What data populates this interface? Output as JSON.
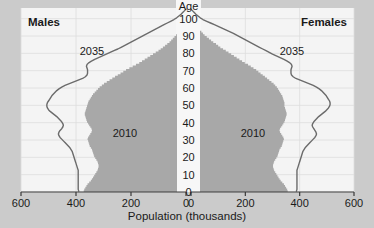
{
  "figure": {
    "background_color": "#c9c9c9",
    "plot_background_color": "#f4f4f4",
    "center_band_color": "#f7f7f7",
    "fill_2010_color": "#a8a8a8",
    "line_2035_color": "#6b6b6b",
    "axis_color": "#3a3a3a",
    "gridline_color": "#dddddd",
    "text_color": "#1a1a1a"
  },
  "labels": {
    "males": "Males",
    "females": "Females",
    "age_axis_title": "Age",
    "population_axis_title": "Population (thousands)",
    "series_outline_left": "2035",
    "series_outline_right": "2035",
    "series_fill_left": "2010",
    "series_fill_right": "2010"
  },
  "axes": {
    "x_ticks_left": [
      "600",
      "400",
      "200",
      "0"
    ],
    "x_ticks_right": [
      "0",
      "200",
      "400",
      "600"
    ],
    "x_tick_values_left": [
      600,
      400,
      200,
      0
    ],
    "x_tick_values_right": [
      0,
      200,
      400,
      600
    ],
    "x_min": 0,
    "x_max": 600,
    "y_ticks": [
      "100",
      "90",
      "80",
      "70",
      "60",
      "50",
      "40",
      "30",
      "20",
      "10",
      "0"
    ],
    "y_tick_values": [
      100,
      90,
      80,
      70,
      60,
      50,
      40,
      30,
      20,
      10,
      0
    ],
    "y_min": 0,
    "y_max": 105,
    "grid": true,
    "legend_position": "inline-annotations"
  },
  "chart_data": {
    "type": "area",
    "title": "",
    "subtitle": "",
    "xlabel": "Population (thousands)",
    "ylabel": "Age",
    "xlim": [
      0,
      600
    ],
    "ylim": [
      0,
      105
    ],
    "grid": true,
    "legend_position": "inline-annotations",
    "orientation": "population-pyramid",
    "panels": [
      {
        "name": "Males",
        "side": "left"
      },
      {
        "name": "Females",
        "side": "right"
      }
    ],
    "ages": [
      0,
      1,
      2,
      3,
      4,
      5,
      6,
      7,
      8,
      9,
      10,
      11,
      12,
      13,
      14,
      15,
      16,
      17,
      18,
      19,
      20,
      21,
      22,
      23,
      24,
      25,
      26,
      27,
      28,
      29,
      30,
      31,
      32,
      33,
      34,
      35,
      36,
      37,
      38,
      39,
      40,
      41,
      42,
      43,
      44,
      45,
      46,
      47,
      48,
      49,
      50,
      51,
      52,
      53,
      54,
      55,
      56,
      57,
      58,
      59,
      60,
      61,
      62,
      63,
      64,
      65,
      66,
      67,
      68,
      69,
      70,
      71,
      72,
      73,
      74,
      75,
      76,
      77,
      78,
      79,
      80,
      81,
      82,
      83,
      84,
      85,
      86,
      87,
      88,
      89,
      90,
      91,
      92,
      93,
      94,
      95,
      96,
      97,
      98,
      99,
      100,
      101,
      102,
      103,
      104,
      105
    ],
    "series": [
      {
        "name": "2010",
        "panel": "Males",
        "style": "filled-area",
        "color": "#a8a8a8",
        "values": [
          372,
          370,
          366,
          362,
          358,
          352,
          346,
          342,
          338,
          334,
          330,
          326,
          322,
          320,
          318,
          318,
          320,
          322,
          326,
          330,
          334,
          336,
          338,
          340,
          342,
          346,
          350,
          352,
          354,
          356,
          358,
          356,
          352,
          348,
          344,
          342,
          344,
          348,
          352,
          356,
          360,
          362,
          364,
          366,
          368,
          368,
          366,
          364,
          362,
          360,
          358,
          356,
          354,
          350,
          346,
          342,
          338,
          332,
          326,
          320,
          314,
          306,
          298,
          288,
          278,
          268,
          258,
          248,
          238,
          228,
          218,
          206,
          194,
          182,
          170,
          160,
          150,
          140,
          130,
          120,
          110,
          100,
          92,
          84,
          76,
          68,
          60,
          54,
          48,
          42,
          36,
          31,
          26,
          22,
          18,
          14,
          11,
          8,
          6,
          4,
          3,
          2,
          1,
          1,
          0,
          0
        ]
      },
      {
        "name": "2035",
        "panel": "Males",
        "style": "outline-line",
        "color": "#6b6b6b",
        "values": [
          390,
          392,
          392,
          392,
          392,
          392,
          392,
          392,
          392,
          392,
          392,
          392,
          392,
          394,
          396,
          398,
          400,
          402,
          404,
          406,
          408,
          410,
          412,
          414,
          418,
          422,
          428,
          434,
          440,
          446,
          452,
          458,
          462,
          464,
          462,
          458,
          452,
          448,
          446,
          448,
          452,
          458,
          464,
          470,
          478,
          486,
          494,
          500,
          504,
          506,
          506,
          504,
          500,
          496,
          492,
          488,
          482,
          476,
          470,
          462,
          452,
          440,
          424,
          408,
          392,
          376,
          366,
          360,
          358,
          358,
          358,
          360,
          362,
          360,
          354,
          344,
          332,
          318,
          304,
          290,
          276,
          262,
          248,
          236,
          224,
          212,
          200,
          188,
          176,
          164,
          152,
          140,
          128,
          116,
          104,
          92,
          80,
          68,
          56,
          44,
          34,
          26,
          18,
          12,
          6,
          0
        ]
      },
      {
        "name": "2010",
        "panel": "Females",
        "style": "filled-area",
        "color": "#a8a8a8",
        "values": [
          356,
          354,
          350,
          346,
          342,
          336,
          330,
          326,
          322,
          318,
          314,
          310,
          306,
          304,
          302,
          302,
          304,
          306,
          310,
          314,
          318,
          320,
          322,
          324,
          326,
          330,
          334,
          336,
          338,
          340,
          342,
          340,
          336,
          332,
          328,
          326,
          328,
          332,
          336,
          340,
          344,
          346,
          348,
          350,
          352,
          352,
          350,
          348,
          346,
          344,
          344,
          344,
          342,
          340,
          338,
          336,
          332,
          328,
          324,
          320,
          316,
          310,
          304,
          296,
          288,
          280,
          272,
          264,
          256,
          248,
          240,
          230,
          220,
          210,
          198,
          188,
          178,
          168,
          158,
          148,
          138,
          128,
          118,
          108,
          100,
          92,
          82,
          74,
          66,
          58,
          50,
          44,
          38,
          32,
          27,
          22,
          18,
          14,
          10,
          7,
          5,
          4,
          3,
          2,
          1,
          0
        ]
      },
      {
        "name": "2035",
        "panel": "Females",
        "style": "outline-line",
        "color": "#6b6b6b",
        "values": [
          388,
          390,
          390,
          390,
          390,
          390,
          390,
          390,
          390,
          390,
          390,
          390,
          390,
          392,
          394,
          396,
          398,
          400,
          402,
          404,
          406,
          408,
          410,
          412,
          416,
          420,
          426,
          432,
          438,
          444,
          450,
          456,
          460,
          462,
          460,
          456,
          452,
          448,
          446,
          448,
          452,
          458,
          464,
          470,
          478,
          486,
          494,
          500,
          506,
          510,
          512,
          512,
          510,
          506,
          502,
          498,
          492,
          486,
          480,
          472,
          462,
          450,
          434,
          418,
          402,
          386,
          376,
          370,
          368,
          368,
          368,
          370,
          372,
          370,
          364,
          354,
          342,
          328,
          314,
          300,
          288,
          276,
          264,
          252,
          240,
          228,
          216,
          204,
          192,
          180,
          168,
          156,
          142,
          128,
          114,
          100,
          86,
          72,
          58,
          44,
          34,
          26,
          18,
          12,
          6,
          0
        ]
      }
    ]
  }
}
